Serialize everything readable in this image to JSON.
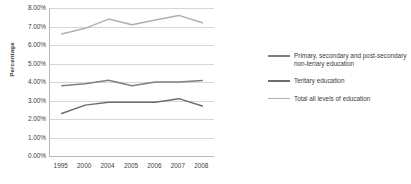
{
  "chart_data": {
    "type": "line",
    "title": "",
    "xlabel": "",
    "ylabel": "Percentage",
    "categories": [
      "1995",
      "2000",
      "2004",
      "2005",
      "2006",
      "2007",
      "2008"
    ],
    "ylim": [
      0,
      8
    ],
    "ytick_labels": [
      "8.00%",
      "7.00%",
      "6.00%",
      "5.00%",
      "4.00%",
      "3.00%",
      "2.00%",
      "1.00%",
      "0.00%"
    ],
    "ytick_values": [
      8,
      7,
      6,
      5,
      4,
      3,
      2,
      1,
      0
    ],
    "grid": true,
    "legend_position": "right",
    "series": [
      {
        "name": "Primary, secondary and post-secondary non-teriary education",
        "color": "#7f7f7f",
        "values": [
          3.8,
          3.9,
          4.1,
          3.8,
          4.0,
          4.0,
          4.08
        ]
      },
      {
        "name": "Teritary education",
        "color": "#6e6e6e",
        "values": [
          2.3,
          2.75,
          2.9,
          2.9,
          2.9,
          3.1,
          2.7
        ]
      },
      {
        "name": "Total all levels of education",
        "color": "#b0b0b0",
        "values": [
          6.6,
          6.9,
          7.4,
          7.1,
          7.35,
          7.6,
          7.2
        ]
      }
    ]
  },
  "legend": {
    "items": [
      {
        "label": "Primary, secondary and post-secondary non-teriary education",
        "color": "#7f7f7f"
      },
      {
        "label": "Teritary education",
        "color": "#6e6e6e"
      },
      {
        "label": "Total all levels of education",
        "color": "#b0b0b0"
      }
    ]
  },
  "colors": {
    "gridline": "#d6d6d6",
    "axis": "#b9b9b9",
    "text": "#3b3b3b",
    "background": "#ffffff"
  }
}
